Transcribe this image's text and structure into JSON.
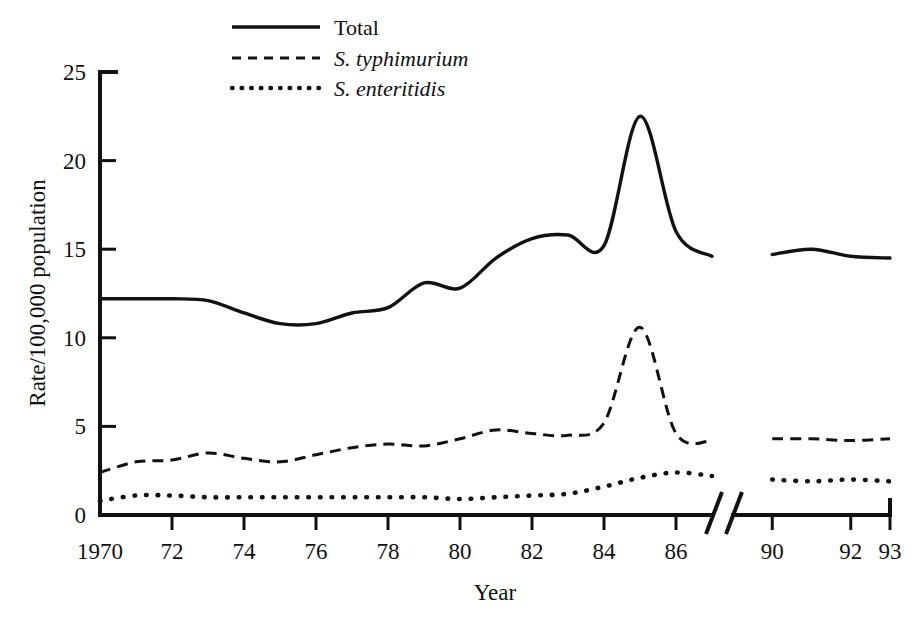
{
  "chart_data": {
    "type": "line",
    "title": "",
    "xlabel": "Year",
    "ylabel": "Rate/100,000 population",
    "xlim": [
      1970,
      1993
    ],
    "ylim": [
      0,
      25
    ],
    "grid": false,
    "legend_position": "top-center",
    "axis_break": {
      "after": 1987,
      "before": 1989,
      "label": "//"
    },
    "x_tick_labels": [
      "1970",
      "72",
      "74",
      "76",
      "78",
      "80",
      "82",
      "84",
      "86",
      "90",
      "92",
      "93"
    ],
    "x_tick_values": [
      1970,
      1972,
      1974,
      1976,
      1978,
      1980,
      1982,
      1984,
      1986,
      1990,
      1992,
      1993
    ],
    "y_tick_labels": [
      "0",
      "5",
      "10",
      "15",
      "20",
      "25"
    ],
    "y_tick_values": [
      0,
      5,
      10,
      15,
      20,
      25
    ],
    "x": [
      1970,
      1971,
      1972,
      1973,
      1974,
      1975,
      1976,
      1977,
      1978,
      1979,
      1980,
      1981,
      1982,
      1983,
      1984,
      1985,
      1986,
      1987,
      1990,
      1991,
      1992,
      1993
    ],
    "series": [
      {
        "name": "Total",
        "style": "solid",
        "values": [
          12.2,
          12.2,
          12.2,
          12.1,
          11.4,
          10.8,
          10.8,
          11.4,
          11.7,
          13.1,
          12.8,
          14.5,
          15.6,
          15.8,
          15.2,
          22.5,
          16.0,
          14.6,
          14.7,
          15.0,
          14.6,
          14.5
        ]
      },
      {
        "name": "S. typhimurium",
        "style": "dashed",
        "values": [
          2.4,
          3.0,
          3.1,
          3.5,
          3.2,
          3.0,
          3.4,
          3.8,
          4.0,
          3.9,
          4.3,
          4.8,
          4.6,
          4.5,
          5.2,
          10.6,
          4.6,
          4.2,
          4.3,
          4.3,
          4.2,
          4.3
        ]
      },
      {
        "name": "S. enteritidis",
        "style": "dotted",
        "values": [
          0.8,
          1.1,
          1.1,
          1.0,
          1.0,
          1.0,
          1.0,
          1.0,
          1.0,
          1.0,
          0.9,
          1.0,
          1.1,
          1.2,
          1.6,
          2.1,
          2.4,
          2.2,
          2.0,
          1.9,
          2.0,
          1.9
        ]
      }
    ]
  },
  "axes": {
    "y_axis_title": "Rate/100,000 population",
    "x_axis_title": "Year",
    "y_ticks": [
      {
        "label": "25",
        "value": 25
      },
      {
        "label": "20",
        "value": 20
      },
      {
        "label": "15",
        "value": 15
      },
      {
        "label": "10",
        "value": 10
      },
      {
        "label": "5",
        "value": 5
      },
      {
        "label": "0",
        "value": 0
      }
    ],
    "x_ticks": [
      {
        "label": "1970",
        "value": 1970
      },
      {
        "label": "72",
        "value": 1972
      },
      {
        "label": "74",
        "value": 1974
      },
      {
        "label": "76",
        "value": 1976
      },
      {
        "label": "78",
        "value": 1978
      },
      {
        "label": "80",
        "value": 1980
      },
      {
        "label": "82",
        "value": 1982
      },
      {
        "label": "84",
        "value": 1984
      },
      {
        "label": "86",
        "value": 1986
      },
      {
        "label": "90",
        "value": 1990
      },
      {
        "label": "92",
        "value": 1992
      },
      {
        "label": "93",
        "value": 1993
      }
    ]
  },
  "legend": {
    "items": [
      {
        "label": "Total",
        "style": "solid",
        "italic": false
      },
      {
        "label": "S. typhimurium",
        "style": "dashed",
        "italic": true
      },
      {
        "label": "S. enteritidis",
        "style": "dotted",
        "italic": true
      }
    ]
  },
  "colors": {
    "ink": "#111111",
    "background": "#ffffff"
  }
}
